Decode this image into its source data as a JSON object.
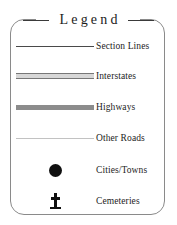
{
  "legend": {
    "title": "Legend",
    "entries": [
      {
        "label": "Section Lines",
        "symbol": "thin-line"
      },
      {
        "label": "Interstates",
        "symbol": "cased-line"
      },
      {
        "label": "Highways",
        "symbol": "thick-line"
      },
      {
        "label": "Other Roads",
        "symbol": "faint-line"
      },
      {
        "label": "Cities/Towns",
        "symbol": "filled-circle"
      },
      {
        "label": "Cemeteries",
        "symbol": "cross"
      }
    ]
  },
  "colors": {
    "frame_border": "#8a8a8a",
    "text": "#1c1c1c",
    "section_lines": "#4a4a4a",
    "interstates_casing": "#777777",
    "interstates_fill": "#d7d7d7",
    "highways": "#8c8c8c",
    "other_roads": "#c2c2c2",
    "city_dot": "#101010",
    "cemetery_cross": "#101010",
    "background": "#ffffff"
  }
}
